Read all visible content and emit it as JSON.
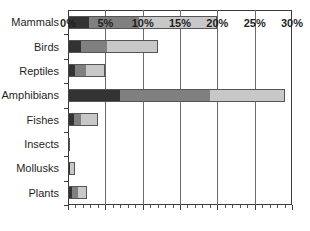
{
  "chart_data": {
    "type": "bar",
    "orientation": "horizontal",
    "stacked": true,
    "title": "",
    "subtitle": "",
    "xlabel": "",
    "ylabel": "",
    "xlim": [
      0,
      30
    ],
    "xunit": "%",
    "grid": true,
    "legend": "none",
    "xticks": [
      0,
      5,
      10,
      15,
      20,
      25,
      30
    ],
    "xticklabels": [
      "0%",
      "5%",
      "10%",
      "15%",
      "20%",
      "25%",
      "30%"
    ],
    "categories": [
      "Mammals",
      "Birds",
      "Reptiles",
      "Amphibians",
      "Fishes",
      "Insects",
      "Mollusks",
      "Plants"
    ],
    "series": [
      {
        "name": "segment-1",
        "color": "#333333",
        "values": [
          2.8,
          1.8,
          1.0,
          7.0,
          0.8,
          0.3,
          0.3,
          0.5
        ]
      },
      {
        "name": "segment-2",
        "color": "#808080",
        "values": [
          6.7,
          3.4,
          1.4,
          12.0,
          0.9,
          0.0,
          0.0,
          0.8
        ]
      },
      {
        "name": "segment-3",
        "color": "#c8c8c8",
        "values": [
          10.5,
          6.8,
          2.6,
          10.0,
          2.3,
          0.0,
          0.7,
          1.3
        ]
      }
    ],
    "totals": [
      20.0,
      12.0,
      5.0,
      29.0,
      4.0,
      0.3,
      1.0,
      2.6
    ]
  },
  "colors": {
    "segment_1": "#333333",
    "segment_2": "#808080",
    "segment_3": "#c8c8c8",
    "axis": "#3a3a3a",
    "grid": "#6a6a6a",
    "background": "#ffffff",
    "text": "#1f1f1f"
  }
}
